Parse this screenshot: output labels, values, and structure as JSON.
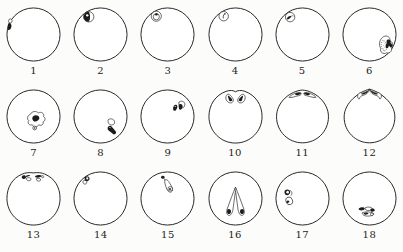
{
  "page": {
    "background": "#fcfcfa"
  },
  "figure": {
    "colors": {
      "ink": "#1c1c1c",
      "paper": "#ffffff",
      "stipple": "#909090"
    },
    "outline_stroke_width": 1.6,
    "bases": {
      "notch": "M50,8.2 C47,5.6 40,5 34,7.4 C16,14 5,30 5,50 C5,75 25,95 50,95 C75,95 95,75 95,50 C95,30 84,14 66,7.4 C60,5 53,5.6 50,8.2 Z",
      "peak1": "M50,5.2 C30,6.4 6,25 6,50.4 C6,75.4 26,94.6 50,94.6 C74,94.6 94,75.4 94,50.4 C94,25 70,6.4 50,5.2 Z",
      "peak2": "M50,3.6 C33,8 7,26 7,51 C7,76 27,94.6 50,94.6 C73,94.6 93,76 93,51 C93,26 67,8 50,3.6 Z",
      "flat": "M50,6.6 C43,5.6 36,6.2 31,8.6 C14,15.6 5,31 5,50 C5,75 25,95 50,95 C75,95 95,75 95,50 C95,31 86,15.6 69,8.6 C64,6.2 57,5.6 50,6.6 Z"
    },
    "items": [
      {
        "label": "1",
        "alt": "dark pigment spot on left margin with small clear vesicle above",
        "base": "circle",
        "marks": [
          {
            "k": "p",
            "d": "M9,24 C12.5,22.5 15,25.5 13.2,29 C11.5,31.8 8.6,31.4 7.8,28.6 C7.6,26.8 8,25 9,24 Z",
            "f": "paper",
            "s": 1.1
          },
          {
            "k": "p",
            "d": "M8.2,30.5 C11.5,30 13.3,33.5 12.4,37.5 C11.6,41 9.2,43.2 6.8,42.3 C5.4,38.5 5.8,33.8 8.2,30.5 Z",
            "f": "ink"
          }
        ]
      },
      {
        "label": "2",
        "alt": "small half-dark cell at upper left",
        "base": "circle",
        "marks": [
          {
            "k": "c",
            "cx": 30,
            "cy": 20,
            "r": 8.8,
            "f": "paper",
            "s": 1.1
          },
          {
            "k": "p",
            "d": "M30,11.4 A8.6,8.6 0 0 0 30,28.6 C33,24.5 33,15.5 30,11.4 Z",
            "f": "ink"
          },
          {
            "k": "c",
            "cx": 27.5,
            "cy": 17.5,
            "r": 2,
            "f": "paper"
          }
        ]
      },
      {
        "label": "3",
        "alt": "small double-walled cell with dark speck at upper left",
        "base": "circle",
        "marks": [
          {
            "k": "c",
            "cx": 31,
            "cy": 19,
            "r": 8.6,
            "f": "paper",
            "s": 1.1
          },
          {
            "k": "c",
            "cx": 31,
            "cy": 20,
            "r": 5.2,
            "f": "paper",
            "s": 1.1
          },
          {
            "k": "p",
            "d": "M28.8,15.8 C29.5,13.3 33,13.2 33.8,15.6 C33.2,17.6 31,18.4 29.6,17.4 C29,16.9 28.8,16.3 28.8,15.8 Z",
            "f": "ink"
          }
        ]
      },
      {
        "label": "4",
        "alt": "small cell with curved tick at upper left",
        "base": "circle",
        "marks": [
          {
            "k": "c",
            "cx": 30,
            "cy": 19,
            "r": 8,
            "f": "paper",
            "s": 1.1
          },
          {
            "k": "l",
            "d": "M29.2,22 C28.6,18.4 30.2,15.2 32.2,14.6",
            "s": 1.3
          },
          {
            "k": "c",
            "cx": 32,
            "cy": 15.2,
            "r": 1.1,
            "f": "ink"
          }
        ]
      },
      {
        "label": "5",
        "alt": "small cell with dark arrow-like body at upper left",
        "base": "circle",
        "marks": [
          {
            "k": "c",
            "cx": 29,
            "cy": 20.5,
            "r": 8,
            "f": "paper",
            "s": 1.1
          },
          {
            "k": "p",
            "d": "M23.2,23.6 C24.4,20 28.6,17.8 30.6,19.2 C31.2,20.6 28.6,23.2 26.2,24.2 C25,24.6 23.8,24.4 23.2,23.6 Z",
            "f": "ink"
          },
          {
            "k": "l",
            "d": "M30,19.6 C31.6,18.4 33,18 34.2,18.4",
            "s": 1
          }
        ]
      },
      {
        "label": "6",
        "alt": "lobed body with stippled oval and dark angular mass at lower right margin",
        "base": "circle",
        "marks": [
          {
            "k": "p",
            "d": "M74,53.5 C80,50.5 86,55 84.5,61 C89.5,62 91,69 86.5,71.5 C89.5,76.5 85,83 79,81 C73.5,84.5 67,80 69,73.5 C65,67 67,57.5 74,53.5 Z",
            "f": "paper",
            "s": 1.1
          },
          {
            "k": "e",
            "cx": 74.5,
            "cy": 69,
            "rx": 4.4,
            "ry": 9,
            "rot": -10,
            "f": "paper",
            "s": 0.9,
            "dash": 1
          },
          {
            "k": "dots",
            "pts": [
              [
                73,
                62.5
              ],
              [
                76,
                65
              ],
              [
                73.5,
                68.5
              ],
              [
                76,
                71.5
              ],
              [
                73.8,
                74.5
              ],
              [
                75.5,
                77
              ]
            ],
            "r": 0.75
          },
          {
            "k": "p",
            "d": "M80,59 C84,57 87.2,60 85.5,63.5 L88.8,67.2 C90.2,69.8 87.4,72.6 85,71 L82.6,68.8 C83.2,72.2 80,74.6 77.8,72.4 C76.6,69.6 77.4,66.6 79.4,65 C78.4,62.8 78.8,60.6 80,59 Z",
            "f": "ink"
          }
        ]
      },
      {
        "label": "7",
        "alt": "multilobed body with dark center and small dotted vesicle, center of egg",
        "base": "circle",
        "marks": [
          {
            "k": "p",
            "d": "M45,46 C47,41 55,40 58,44 C63,41 69,45 67,50 C71,52 70,58 66,59 C68,63 63,67 59,64 C57,68 50,69 48,64 C43,66 39,61 42,57 C38,54 40,48 45,46 Z",
            "f": "paper",
            "s": 1.1
          },
          {
            "k": "p",
            "d": "M49,50 C53,46.5 60,48 60,53 C59,57.5 52.5,60.5 49.5,57 C47.5,54.8 47.5,52 49,50 Z",
            "f": "ink"
          },
          {
            "k": "c",
            "cx": 52,
            "cy": 69.5,
            "r": 3.2,
            "f": "paper",
            "s": 1.1
          },
          {
            "k": "c",
            "cx": 52,
            "cy": 69.5,
            "r": 1.2,
            "f": "ink"
          }
        ]
      },
      {
        "label": "8",
        "alt": "outlined lobe with dark elongated body running to lower right margin",
        "base": "circle",
        "marks": [
          {
            "k": "p",
            "d": "M63,55.5 C68,52 74.8,55 73.8,60.8 C73,64.8 66.5,65.8 64.2,62.2 C62.8,60 62.4,57.4 63,55.5 Z",
            "f": "paper",
            "s": 1.1
          },
          {
            "k": "p",
            "d": "M62,70 C62,66.4 66.6,64.4 68.8,67 L76,75.5 C77.8,78.8 73.6,82 70.8,79.4 L63.2,73.2 C62.3,72.3 61.9,71.2 62,70 Z",
            "f": "ink"
          },
          {
            "k": "c",
            "cx": 66,
            "cy": 68.6,
            "r": 1,
            "f": "paper"
          }
        ]
      },
      {
        "label": "9",
        "alt": "pair of dark teardrops with outlined loop at upper right",
        "base": "circle",
        "marks": [
          {
            "k": "p",
            "d": "M69.5,25.5 C75.5,21.5 81.5,26.5 78.8,32.5 C76.8,36.5 71,36.5 69.8,32.5 C69.2,30 69,27.5 69.5,25.5 Z",
            "f": "paper",
            "s": 1.1
          },
          {
            "k": "p",
            "d": "M59.5,37.5 C58.8,33 62.5,28.8 65.6,30.6 C67.6,32.4 66.8,36.4 64.2,39.4 C62.2,41.4 60,40.4 59.5,37.5 Z",
            "f": "ink"
          },
          {
            "k": "p",
            "d": "M69.8,29.5 C72.6,27.5 75.8,29.3 75.6,33 C75.4,36.6 72.6,39.4 70.4,38 C68.8,36 68.6,31.8 69.8,29.5 Z",
            "f": "ink"
          },
          {
            "k": "c",
            "cx": 63,
            "cy": 33,
            "r": 1,
            "f": "paper"
          }
        ]
      },
      {
        "label": "10",
        "alt": "two mirrored comma bodies with dark heads below notched top pole",
        "base": "notch",
        "marks": [
          {
            "k": "p",
            "d": "M36,12.5 C31.5,16.5 33.5,25 40,26.8 C45.2,28 48,23.2 45.2,19 C43,15.2 39,11 36,12.5 Z",
            "f": "paper",
            "s": 1.1
          },
          {
            "k": "p",
            "d": "M37.2,14.2 C40.2,15.4 43.8,18.8 44.8,22.3 C43.3,25.4 39.3,24.4 38.8,21.4 C38,18.6 37,16.4 37.2,14.2 Z",
            "f": "ink"
          },
          {
            "k": "p",
            "d": "M64,12.5 C68.5,16.5 66.5,25 60,26.8 C54.8,28 52,23.2 54.8,19 C57,15.2 61,11 64,12.5 Z",
            "f": "paper",
            "s": 1.1
          },
          {
            "k": "p",
            "d": "M62.8,14.2 C59.8,15.4 56.2,18.8 55.2,22.3 C56.7,25.4 60.7,24.4 61.2,21.4 C62,18.6 63,16.4 62.8,14.2 Z",
            "f": "ink"
          }
        ]
      },
      {
        "label": "11",
        "alt": "two dark-cored wings lying along top arc beside small peak",
        "base": "peak1",
        "marks": [
          {
            "k": "p",
            "d": "M27,17.5 C31,12.5 41,8.5 47,9.5 C49.4,11.5 47,14.2 43,14.8 C37,15.8 31,19 27,17.5 Z",
            "f": "paper",
            "s": 1.1
          },
          {
            "k": "p",
            "d": "M38,10.8 C42,9.2 46.6,9.6 47.6,11.2 C46.6,13.2 42,14.2 38.6,13.6 C37.2,12.8 37.2,11.8 38,10.8 Z",
            "f": "ink"
          },
          {
            "k": "p",
            "d": "M73,17.5 C69,12.5 59,8.5 53,9.5 C50.6,11.5 53,14.2 57,14.8 C63,15.8 69,19 73,17.5 Z",
            "f": "paper",
            "s": 1.1
          },
          {
            "k": "p",
            "d": "M62,10.8 C58,9.2 53.4,9.6 52.4,11.2 C53.4,13.2 58,14.2 61.4,13.6 C62.8,12.8 62.8,11.8 62,10.8 Z",
            "f": "ink"
          }
        ]
      },
      {
        "label": "12",
        "alt": "two paisley wings with dark cores meeting at pointed top pole",
        "base": "peak2",
        "marks": [
          {
            "k": "p",
            "d": "M31,19.5 C27.5,14 32,8.8 38,9 C44,9.2 48,6.5 50,4.5 C48.5,9.5 44,13 39,14.2 C35.5,15.2 33.5,17.2 32.8,20 C32.2,20.6 31.5,20.4 31,19.5 Z",
            "f": "paper",
            "s": 1.1
          },
          {
            "k": "p",
            "d": "M36,11.2 C40,9.6 46,7.6 48.8,5.8 C47,9.4 43,11.8 38.6,12.8 C36.6,12.9 35.6,12.2 36,11.2 Z",
            "f": "ink"
          },
          {
            "k": "p",
            "d": "M69,19.5 C72.5,14 68,8.8 62,9 C56,9.2 52,6.5 50,4.5 C51.5,9.5 56,13 61,14.2 C64.5,15.2 66.5,17.2 67.2,20 C67.8,20.6 68.5,20.4 69,19.5 Z",
            "f": "paper",
            "s": 1.1
          },
          {
            "k": "p",
            "d": "M64,11.2 C60,9.6 54,7.6 51.2,5.8 C53,9.4 57,11.8 61.4,12.8 C63.4,12.9 64.4,12.2 64,11.2 Z",
            "f": "ink"
          }
        ]
      },
      {
        "label": "13",
        "alt": "two dark comma bodies with outline loops straddling flattened top pole",
        "base": "flat",
        "marks": [
          {
            "k": "p",
            "d": "M38,15.5 C42.5,13.5 46.5,15 45.5,18.2 C44,20.8 39.2,20.2 38.2,17.6 C37.9,16.8 37.9,16.1 38,15.5 Z",
            "f": "paper",
            "s": 1.1
          },
          {
            "k": "p",
            "d": "M30.2,12.5 C32.2,9.8 36.4,10.4 37.2,13.2 C37.8,15.8 35,17.8 32.4,16.8 C30.6,15.9 29.8,14.1 30.2,12.5 Z",
            "f": "ink"
          },
          {
            "k": "p",
            "d": "M36.8,12 C39.4,10.2 42.8,9.8 44.4,10.8 C43,12.4 39.6,13.4 37.4,13.4 Z",
            "f": "ink"
          },
          {
            "k": "p",
            "d": "M55,16.5 C59,14.8 62.8,16.2 62,19 C60.4,21.6 55.8,20.8 55,18.4 Z",
            "f": "paper",
            "s": 1.1
          },
          {
            "k": "p",
            "d": "M52.8,11.8 C56.5,9.6 62,9.6 64.2,11.6 C63.2,14.2 57.8,15.2 54.4,14.4 C53,13.7 52.5,12.7 52.8,11.8 Z",
            "f": "ink"
          },
          {
            "k": "c",
            "cx": 65.5,
            "cy": 13,
            "r": 1.8,
            "f": "paper",
            "s": 1
          }
        ]
      },
      {
        "label": "14",
        "alt": "dark crescent with clear vesicle on upper left margin",
        "base": "circle",
        "marks": [
          {
            "k": "p",
            "d": "M21.5,19.5 C24.5,17.8 27.8,20 26.6,23.6 C25.2,26.8 21,25.8 20.4,22.8 C20.2,21.5 20.6,20.3 21.5,19.5 Z",
            "f": "paper",
            "s": 1.1
          },
          {
            "k": "p",
            "d": "M23.8,13.2 C27.8,10.8 32,13 31.4,17 C30.8,20.2 27.2,21.6 24.6,20 C22.6,18 22.6,15.2 23.8,13.2 Z",
            "f": "ink"
          },
          {
            "k": "c",
            "cx": 27.6,
            "cy": 16,
            "r": 1.9,
            "f": "paper"
          }
        ]
      },
      {
        "label": "15",
        "alt": "dark speck trailing an outlined teardrop with dotted bulb, upper center",
        "base": "circle",
        "marks": [
          {
            "k": "l",
            "d": "M44.5,16.5 C45.5,18 46.5,19.5 47.5,21",
            "s": 1
          },
          {
            "k": "p",
            "d": "M38.8,14 C39.6,11.2 43.6,10.6 45.2,13 C45.6,15.4 42.8,17.2 40.6,16.2 C39.6,15.7 39,14.9 38.8,14 Z",
            "f": "ink"
          },
          {
            "k": "p",
            "d": "M45.5,18.5 C48.5,17 51.5,19.5 54,24.5 C57,29.5 60,33.5 58,37.5 C55.5,41 50.5,39 48.5,33.5 C46.5,28.5 44.5,21.5 45.5,18.5 Z",
            "f": "paper",
            "s": 1.1
          },
          {
            "k": "c",
            "cx": 54.5,
            "cy": 33.5,
            "r": 3.8,
            "f": "paper",
            "s": 1
          },
          {
            "k": "c",
            "cx": 54.2,
            "cy": 33.8,
            "r": 1.6,
            "f": "ink"
          }
        ]
      },
      {
        "label": "16",
        "alt": "two long teardrops forming inverted V with dark bottom tips",
        "base": "circle",
        "marks": [
          {
            "k": "p",
            "d": "M50,31 C46,40 40.5,55 36,67.5 C34.2,72.8 34.8,77.5 38.2,78.6 C42,79.4 44.8,74.6 45.8,68 C47.4,56.5 49,41 51,33 Z",
            "f": "paper",
            "s": 1.1
          },
          {
            "k": "p",
            "d": "M50,31 C54,40 59.5,55 64,67.5 C65.8,72.8 65.2,77.5 61.8,78.6 C58,79.4 55.2,74.6 54.2,68 C52.6,56.5 51,41 49,33 Z",
            "f": "paper",
            "s": 1.1
          },
          {
            "k": "p",
            "d": "M36.4,68.5 C38.8,66.5 42,68 42.4,71.5 C42.7,74.6 40,77.2 37.6,76.2 C35.4,75 35.1,71 36.4,68.5 Z",
            "f": "ink"
          },
          {
            "k": "p",
            "d": "M63.6,68.5 C61.2,66.5 58,68 57.6,71.5 C57.3,74.6 60,77.2 62.4,76.2 C64.6,75 64.9,71 63.6,68.5 Z",
            "f": "ink"
          }
        ]
      },
      {
        "label": "17",
        "alt": "dark crescent body above outlined oval with dark speck at left margin",
        "base": "circle",
        "marks": [
          {
            "k": "l",
            "d": "M29.5,36.5 C32.5,38 33.2,42 31,44.5",
            "s": 1
          },
          {
            "k": "p",
            "d": "M20,36.5 C23.5,33 29,34.5 29.2,39 C29.2,43.2 24.5,45.8 21.2,43.8 C19.2,41.8 19.2,38.8 20,36.5 Z",
            "f": "ink"
          },
          {
            "k": "c",
            "cx": 24.8,
            "cy": 39.2,
            "r": 2.2,
            "f": "paper"
          },
          {
            "k": "e",
            "cx": 27.5,
            "cy": 54,
            "rx": 5.6,
            "ry": 6.6,
            "rot": -18,
            "f": "paper",
            "s": 1.1
          },
          {
            "k": "p",
            "d": "M22.8,55.5 C23.8,52.8 27,52.8 27.8,55.2 C27.4,57.6 24.4,58.4 23.2,57 Z",
            "f": "ink"
          }
        ]
      },
      {
        "label": "18",
        "alt": "cluster of elongated dark-tipped bodies lying at lower left",
        "base": "circle",
        "marks": [
          {
            "k": "p",
            "d": "M43,65.5 C48,63.5 54,64.5 55,67.5 C54,70.5 47.5,71.3 44,69.5 C42.6,68.4 42.4,66.8 43,65.5 Z",
            "f": "paper",
            "s": 1.1
          },
          {
            "k": "p",
            "d": "M31.8,66.8 C35.5,64.2 40.8,64.6 42.2,67 C41.4,69.8 36.2,71 33.2,69.6 C31.8,68.8 31.4,67.8 31.8,66.8 Z",
            "f": "ink"
          },
          {
            "k": "p",
            "d": "M52,67.8 C55,66.2 58.6,67.4 59,69.8 C58.2,72.4 54.2,73 52.2,71.4 C51.2,70.2 51.3,68.9 52,67.8 Z",
            "f": "ink"
          },
          {
            "k": "p",
            "d": "M38,73.8 C44,71.6 54,72.6 57.6,75.8 C57,79.2 48,80.8 42,79.2 C38.6,78 37.2,75.8 38,73.8 Z",
            "f": "paper",
            "s": 1.1
          },
          {
            "k": "p",
            "d": "M40.2,74.8 C43.2,73.2 47.2,73.6 48.2,75.6 C47.2,77.6 42.6,78 40.6,76.8 C39.9,76.2 39.9,75.4 40.2,74.8 Z",
            "f": "ink"
          },
          {
            "k": "c",
            "cx": 54,
            "cy": 76.8,
            "r": 2.4,
            "f": "paper",
            "s": 1
          }
        ]
      }
    ]
  }
}
